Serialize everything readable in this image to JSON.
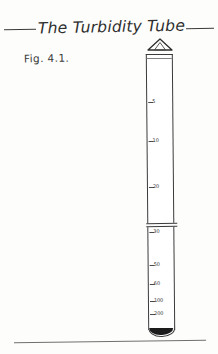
{
  "figure": {
    "title": "The Turbidity Tube",
    "caption": "Fig. 4.1.",
    "cap_icon": "triangle-cone-icon"
  },
  "colors": {
    "ink": "#2e2e2e",
    "line": "#3b3b3b",
    "sediment": "#1c1c1c",
    "paper": "#fdfdfb"
  },
  "tube": {
    "band_label": "joint-band",
    "base_label": "rounded-base",
    "fill_label": "sediment-fill",
    "scale_unit": "NTU"
  },
  "chart_data": {
    "type": "scatter",
    "title": "The Turbidity Tube",
    "xlabel": "",
    "ylabel": "NTU",
    "categories": [
      "5",
      "10",
      "20",
      "30",
      "50",
      "60",
      "100",
      "200"
    ],
    "values": [
      5,
      10,
      20,
      30,
      50,
      60,
      100,
      200
    ],
    "ticks": [
      {
        "label": "5",
        "value": 5,
        "pos": 17
      },
      {
        "label": "10",
        "value": 10,
        "pos": 31
      },
      {
        "label": "20",
        "value": 20,
        "pos": 48
      },
      {
        "label": "30",
        "value": 30,
        "pos": 64
      },
      {
        "label": "50",
        "value": 50,
        "pos": 76
      },
      {
        "label": "60",
        "value": 60,
        "pos": 83
      },
      {
        "label": "100",
        "value": 100,
        "pos": 89
      },
      {
        "label": "200",
        "value": 200,
        "pos": 94
      }
    ],
    "band_pos": 61,
    "grid": false,
    "legend": "none"
  }
}
